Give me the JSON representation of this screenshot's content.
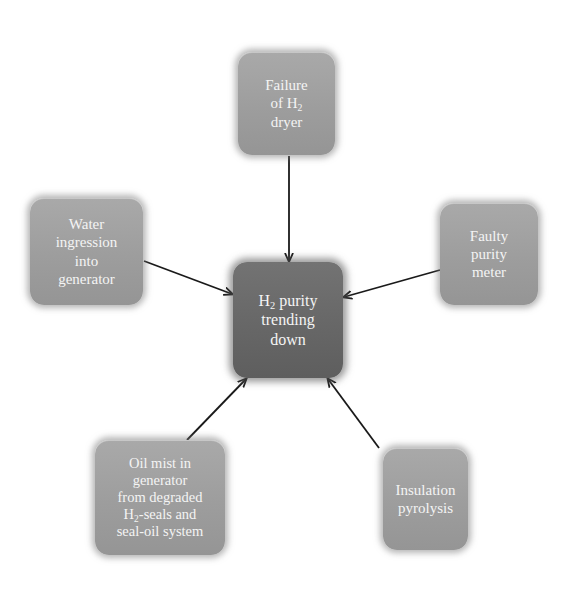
{
  "diagram": {
    "type": "cause-effect hub",
    "center": {
      "id": "effect",
      "label_pre": "H",
      "label_sub": "2",
      "label_post": " purity\ntrending\ndown",
      "fill": "#6a6a6a"
    },
    "causes": [
      {
        "id": "h2-dryer-failure",
        "label_pre": "Failure\nof H",
        "label_sub": "2",
        "label_post": "\ndryer",
        "position": "top"
      },
      {
        "id": "water-ingression",
        "label_pre": "Water\ningression\ninto\ngenerator",
        "label_sub": "",
        "label_post": "",
        "position": "left"
      },
      {
        "id": "faulty-purity-meter",
        "label_pre": "Faulty\npurity\nmeter",
        "label_sub": "",
        "label_post": "",
        "position": "right"
      },
      {
        "id": "oil-mist",
        "label_pre": "Oil mist in\ngenerator\nfrom degraded\nH",
        "label_sub": "2",
        "label_post": "-seals and\nseal-oil system",
        "position": "bottom-left"
      },
      {
        "id": "insulation-pyrolysis",
        "label_pre": "Insulation\npyrolysis",
        "label_sub": "",
        "label_post": "",
        "position": "bottom-right"
      }
    ],
    "colors": {
      "cause_fill": "#a0a0a0",
      "effect_fill": "#6a6a6a",
      "text": "#f4f4f4",
      "arrow": "#1a1a1a",
      "background": "#ffffff"
    }
  }
}
